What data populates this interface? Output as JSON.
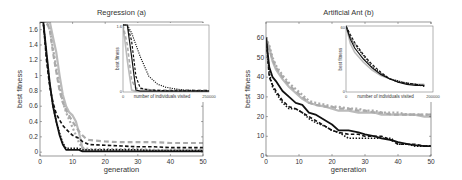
{
  "chart_data": [
    {
      "type": "line",
      "title": "Regression (a)",
      "xlabel": "generation",
      "ylabel": "best fitness",
      "xlim": [
        0,
        50
      ],
      "ylim": [
        -0.05,
        1.7
      ],
      "xticks": [
        "0",
        "10",
        "20",
        "30",
        "40",
        "50"
      ],
      "yticks": [
        "0",
        "0.2",
        "0.4",
        "0.6",
        "0.8",
        "1",
        "1.2",
        "1.4",
        "1.6"
      ],
      "grid": false,
      "legend": null,
      "x": [
        0,
        1,
        2,
        3,
        4,
        5,
        6,
        7,
        8,
        9,
        10,
        11,
        12,
        13,
        14,
        15,
        20,
        25,
        30,
        35,
        40,
        45,
        50
      ],
      "series": [
        {
          "name": "black solid",
          "color": "#111111",
          "dash": "solid",
          "values": [
            1.7,
            1.7,
            1.3,
            0.9,
            0.6,
            0.4,
            0.22,
            0.1,
            0.03,
            0.03,
            0.03,
            0.03,
            0.03,
            0.01,
            0.01,
            0.01,
            0.01,
            0.01,
            0.01,
            0.01,
            0.01,
            0.01,
            0.01
          ]
        },
        {
          "name": "black dashed",
          "color": "#111111",
          "dash": "dashed",
          "values": [
            1.7,
            1.7,
            1.2,
            0.85,
            0.65,
            0.5,
            0.42,
            0.35,
            0.3,
            0.26,
            0.22,
            0.2,
            0.18,
            0.14,
            0.12,
            0.1,
            0.09,
            0.08,
            0.07,
            0.07,
            0.06,
            0.06,
            0.06
          ]
        },
        {
          "name": "black dotted",
          "color": "#111111",
          "dash": "dotted",
          "values": [
            1.7,
            1.7,
            1.25,
            0.88,
            0.6,
            0.4,
            0.25,
            0.12,
            0.05,
            0.05,
            0.05,
            0.05,
            0.05,
            0.03,
            0.03,
            0.03,
            0.03,
            0.03,
            0.03,
            0.02,
            0.02,
            0.02,
            0.02
          ]
        },
        {
          "name": "gray solid",
          "color": "#bbbbbb",
          "dash": "solid",
          "values": [
            1.7,
            1.7,
            1.7,
            1.7,
            1.5,
            1.3,
            1.0,
            0.75,
            0.6,
            0.52,
            0.48,
            0.4,
            0.25,
            0.05,
            0.03,
            0.02,
            0.02,
            0.02,
            0.02,
            0.02,
            0.02,
            0.02,
            0.02
          ]
        },
        {
          "name": "gray dashed",
          "color": "#aaaaaa",
          "dash": "dashed",
          "values": [
            1.7,
            1.7,
            1.7,
            1.6,
            1.3,
            1.05,
            0.8,
            0.65,
            0.55,
            0.47,
            0.4,
            0.33,
            0.27,
            0.22,
            0.18,
            0.16,
            0.14,
            0.13,
            0.13,
            0.13,
            0.12,
            0.12,
            0.12
          ]
        },
        {
          "name": "gray dotted",
          "color": "#aaaaaa",
          "dash": "dotted",
          "values": [
            1.7,
            1.7,
            1.7,
            1.6,
            1.35,
            1.1,
            0.85,
            0.66,
            0.52,
            0.42,
            0.32,
            0.22,
            0.12,
            0.06,
            0.05,
            0.04,
            0.04,
            0.04,
            0.04,
            0.03,
            0.03,
            0.03,
            0.03
          ]
        }
      ],
      "inset": {
        "xlabel": "number of individuals visited",
        "ylabel": "best fitness",
        "xticks": [
          "0",
          "250000"
        ],
        "yticks": [
          "0",
          "1.6"
        ],
        "x": [
          0,
          0.05,
          0.1,
          0.15,
          0.2,
          0.3,
          0.4,
          0.5,
          0.6,
          0.7,
          0.8,
          0.9,
          1.0
        ],
        "series": [
          {
            "name": "black solid",
            "color": "#111111",
            "dash": "solid",
            "values": [
              1.7,
              1.7,
              0.9,
              0.05,
              0.02,
              0.02,
              0.02,
              0.02,
              0.02,
              0.02,
              0.02,
              0.02,
              0.02
            ]
          },
          {
            "name": "black dashed",
            "color": "#111111",
            "dash": "dashed",
            "values": [
              1.7,
              1.7,
              1.3,
              0.4,
              0.1,
              0.05,
              0.04,
              0.03,
              0.03,
              0.03,
              0.03,
              0.03,
              0.03
            ]
          },
          {
            "name": "black dotted",
            "color": "#111111",
            "dash": "dotted",
            "values": [
              1.7,
              1.7,
              1.5,
              1.2,
              0.9,
              0.4,
              0.2,
              0.12,
              0.08,
              0.05,
              0.04,
              0.03,
              0.03
            ]
          },
          {
            "name": "gray solid",
            "color": "#bbbbbb",
            "dash": "solid",
            "values": [
              1.7,
              0.8,
              0.05,
              0.02,
              0.02,
              0.02,
              0.02,
              0.02,
              0.02,
              0.02,
              0.02,
              0.02,
              0.02
            ]
          },
          {
            "name": "gray dashed",
            "color": "#aaaaaa",
            "dash": "dashed",
            "values": [
              1.7,
              1.2,
              0.3,
              0.1,
              0.08,
              0.06,
              0.05,
              0.05,
              0.05,
              0.05,
              0.05,
              0.05,
              0.05
            ]
          }
        ]
      }
    },
    {
      "type": "line",
      "title": "Artificial Ant (b)",
      "xlabel": "generation",
      "ylabel": "best fitness",
      "xlim": [
        0,
        50
      ],
      "ylim": [
        0,
        68
      ],
      "xticks": [
        "0",
        "10",
        "20",
        "30",
        "40",
        "50"
      ],
      "yticks": [
        "0",
        "10",
        "20",
        "30",
        "40",
        "50",
        "60"
      ],
      "grid": false,
      "legend": null,
      "x": [
        0,
        1,
        2,
        3,
        5,
        7,
        9,
        11,
        13,
        15,
        18,
        20,
        22,
        25,
        28,
        30,
        33,
        35,
        38,
        40,
        43,
        45,
        48,
        50
      ],
      "series": [
        {
          "name": "black solid",
          "color": "#111111",
          "dash": "solid",
          "values": [
            60,
            45,
            40,
            38,
            33,
            30,
            27,
            26,
            22,
            21,
            18,
            16,
            13,
            13,
            12,
            11,
            10,
            9,
            8,
            7,
            6,
            5.5,
            5,
            5
          ]
        },
        {
          "name": "black dashed",
          "color": "#111111",
          "dash": "dashed",
          "values": [
            60,
            40,
            36,
            33,
            28,
            25,
            24,
            22,
            20,
            18,
            15,
            13,
            12,
            11,
            11,
            10,
            10,
            10,
            8,
            6,
            6,
            6,
            5,
            5
          ]
        },
        {
          "name": "black dotted",
          "color": "#111111",
          "dash": "dotted",
          "values": [
            60,
            42,
            35,
            32,
            27,
            24,
            24,
            22,
            19,
            17,
            15,
            13,
            12,
            9,
            9,
            9,
            9,
            9,
            9,
            6,
            6,
            5,
            5,
            5
          ]
        },
        {
          "name": "gray solid",
          "color": "#bbbbbb",
          "dash": "solid",
          "values": [
            60,
            55,
            48,
            44,
            39,
            35,
            32,
            29,
            27,
            26,
            25,
            24,
            23,
            23,
            22,
            22,
            22,
            21,
            21,
            21,
            21,
            21,
            20,
            20
          ]
        },
        {
          "name": "gray dashed",
          "color": "#aaaaaa",
          "dash": "dashed",
          "values": [
            60,
            54,
            49,
            45,
            40,
            36,
            33,
            30,
            27,
            26,
            25,
            25,
            24,
            24,
            23,
            23,
            22,
            22,
            21,
            21,
            21,
            21,
            21,
            21
          ]
        },
        {
          "name": "gray dotted",
          "color": "#aaaaaa",
          "dash": "dotted",
          "values": [
            60,
            56,
            50,
            46,
            41,
            37,
            34,
            31,
            28,
            27,
            26,
            25,
            25,
            24,
            24,
            23,
            23,
            22,
            22,
            22,
            21,
            21,
            21,
            21
          ]
        }
      ],
      "inset": {
        "xlabel": "number of individuals visited",
        "ylabel": "best fitness",
        "xticks": [
          "0",
          "200000"
        ],
        "yticks": [
          "0",
          "60"
        ],
        "x": [
          0,
          0.05,
          0.1,
          0.2,
          0.3,
          0.4,
          0.5,
          0.6,
          0.7,
          0.8,
          0.9
        ],
        "series": [
          {
            "name": "black solid",
            "color": "#111111",
            "dash": "solid",
            "values": [
              60,
              48,
              40,
              30,
              22,
              16,
              12,
              9,
              7,
              6,
              6
            ]
          },
          {
            "name": "black dashed",
            "color": "#111111",
            "dash": "dashed",
            "values": [
              60,
              52,
              45,
              34,
              25,
              18,
              12,
              9,
              8,
              7,
              5
            ]
          },
          {
            "name": "black dotted",
            "color": "#111111",
            "dash": "dotted",
            "values": [
              60,
              50,
              43,
              33,
              23,
              17,
              12,
              10,
              8,
              7,
              6
            ]
          },
          {
            "name": "gray solid",
            "color": "#bbbbbb",
            "dash": "solid",
            "values": [
              60,
              44,
              36,
              27,
              20,
              15,
              12,
              10,
              8,
              7,
              7
            ]
          }
        ]
      }
    }
  ]
}
